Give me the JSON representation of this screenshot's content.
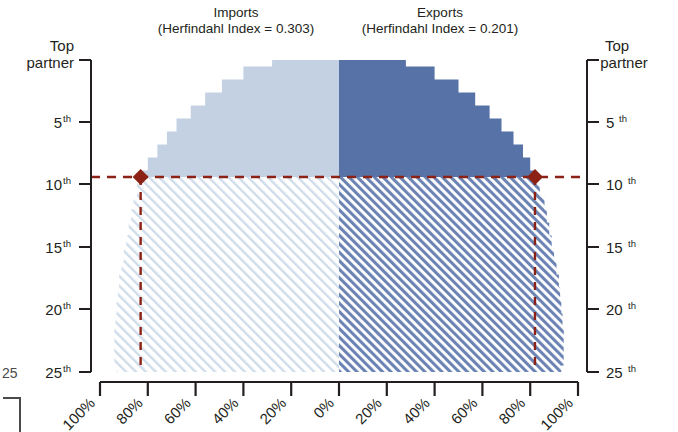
{
  "titles": {
    "left_line1": "Imports",
    "left_line2": "(Herfindahl Index = 0.303)",
    "right_line1": "Exports",
    "right_line2": "(Herfindahl Index = 0.201)"
  },
  "axes": {
    "y_left": {
      "ticks": [
        {
          "label": "Top",
          "label2": "partner",
          "sup": "",
          "value": 1
        },
        {
          "label": "5",
          "sup": "th",
          "value": 5
        },
        {
          "label": "10",
          "sup": "th",
          "value": 10
        },
        {
          "label": "15",
          "sup": "th",
          "value": 15
        },
        {
          "label": "20",
          "sup": "th",
          "value": 20
        },
        {
          "label": "25",
          "sup": "th",
          "value": 25
        }
      ]
    },
    "y_right": {
      "ticks": [
        {
          "label": "Top",
          "label2": "partner",
          "sup": "",
          "value": 1
        },
        {
          "label": "5",
          "sup": "th",
          "value": 5
        },
        {
          "label": "10",
          "sup": "th",
          "value": 10
        },
        {
          "label": "15",
          "sup": "th",
          "value": 15
        },
        {
          "label": "20",
          "sup": "th",
          "value": 20
        },
        {
          "label": "25",
          "sup": "th",
          "value": 25
        }
      ]
    },
    "x": {
      "ticks": [
        "100%",
        "80%",
        "60%",
        "40%",
        "20%",
        "0%",
        "20%",
        "40%",
        "60%",
        "80%",
        "100%"
      ]
    }
  },
  "cut_label": {
    "text": "25",
    "sup": ""
  },
  "markers": {
    "left": {
      "rank": 10,
      "share_pct": 83
    },
    "right": {
      "rank": 10,
      "share_pct": 82
    }
  },
  "colors": {
    "light_blue": "#c3d1e3",
    "dark_blue": "#5672a7",
    "hatch_light": "#cfdcea",
    "hatch_dark": "#6c84b4",
    "marker": "#8c2216",
    "axis": "#231f20"
  },
  "chart_data": {
    "type": "area",
    "xlabel": "",
    "ylabel": "Partner rank",
    "xlim": [
      -100,
      100
    ],
    "ylim": [
      0.5,
      25.5
    ],
    "grid": false,
    "legend": "none",
    "series": [
      {
        "name": "Imports (solid, ranks 1-10)",
        "side": "left",
        "fill": "#c3d1e3",
        "ranks": [
          1,
          2,
          3,
          4,
          5,
          6,
          7,
          8,
          9,
          10
        ],
        "cumulative_pct": [
          28,
          40,
          49,
          56,
          62,
          68,
          72,
          76,
          80,
          83
        ]
      },
      {
        "name": "Imports (hatched, ranks 10-25)",
        "side": "left",
        "fill": "hatch-light",
        "ranks": [
          10,
          12,
          14,
          16,
          18,
          20,
          22,
          24,
          25
        ],
        "cumulative_pct": [
          83,
          86,
          88,
          90,
          92,
          93,
          94,
          94,
          93
        ]
      },
      {
        "name": "Exports (solid, ranks 1-10)",
        "side": "right",
        "fill": "#5672a7",
        "ranks": [
          1,
          2,
          3,
          4,
          5,
          6,
          7,
          8,
          9,
          10
        ],
        "cumulative_pct": [
          28,
          40,
          50,
          57,
          63,
          68,
          73,
          77,
          80,
          82
        ]
      },
      {
        "name": "Exports (hatched, ranks 10-25)",
        "side": "right",
        "fill": "hatch-dark",
        "ranks": [
          10,
          12,
          14,
          16,
          18,
          20,
          22,
          24,
          25
        ],
        "cumulative_pct": [
          82,
          86,
          88,
          90,
          92,
          93,
          94,
          94,
          93
        ]
      }
    ],
    "annotations": [
      {
        "type": "marker",
        "shape": "diamond",
        "side": "left",
        "rank": 10,
        "pct": 83,
        "color": "#8c2216"
      },
      {
        "type": "marker",
        "shape": "diamond",
        "side": "right",
        "rank": 10,
        "pct": 82,
        "color": "#8c2216"
      },
      {
        "type": "dashed-horizontal",
        "rank": 10,
        "color": "#8c2216"
      },
      {
        "type": "dashed-vertical",
        "side": "left",
        "pct": 83,
        "color": "#8c2216"
      },
      {
        "type": "dashed-vertical",
        "side": "right",
        "pct": 82,
        "color": "#8c2216"
      }
    ]
  }
}
